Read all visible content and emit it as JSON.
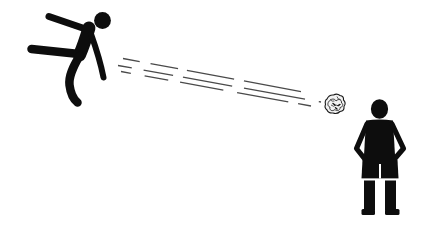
{
  "scene": {
    "description": "Monochrome pictogram: a figure on the left has kicked a crumpled ball, which flies along dashed motion lines toward a person standing on the right with hands on hips",
    "background_color": "#ffffff",
    "figure_color": "#0d0d0d",
    "motion_line_color": "#4a4a4a",
    "ball": {
      "style": "crumpled-scribbled-ball",
      "outline_color": "#1a1a1a",
      "fill_color": "#f2f2f2"
    },
    "elements": [
      {
        "name": "kicker-figure",
        "description": "stick-figure leaning forward, one leg extended left after the kick, one arm swung back"
      },
      {
        "name": "motion-lines",
        "description": "three parallel dashed speed lines descending from the kicker toward the ball, dashes lengthening near the ball"
      },
      {
        "name": "crumpled-ball",
        "description": "small scribbled crumpled ball in flight"
      },
      {
        "name": "receiver-figure",
        "description": "solid silhouette standing facing forward, hands on hips, wearing shorts"
      }
    ]
  }
}
